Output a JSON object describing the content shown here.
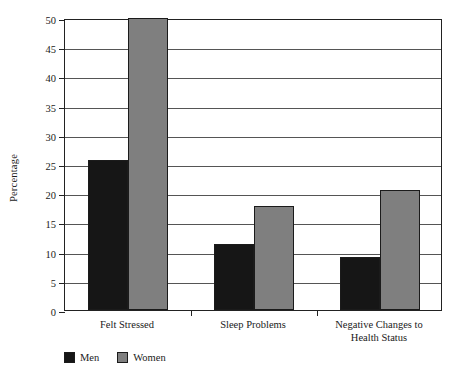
{
  "chart_data": {
    "type": "bar",
    "title": "",
    "xlabel": "",
    "ylabel": "Percentage",
    "ylim": [
      0,
      50
    ],
    "ytick_step": 5,
    "yticks": [
      0,
      5,
      10,
      15,
      20,
      25,
      30,
      35,
      40,
      45,
      50
    ],
    "ytick_labels": [
      "0",
      "5",
      "10",
      "15",
      "20",
      "25",
      "30",
      "35",
      "40",
      "45",
      "50"
    ],
    "grid": true,
    "grid_axis": "y",
    "legend_position": "below-bottom-left",
    "categories": [
      "Felt Stressed",
      "Sleep Problems",
      "Negative Changes to\nHealth Status"
    ],
    "series": [
      {
        "name": "Men",
        "color": "#161616",
        "values": [
          25.7,
          11.3,
          9.1
        ]
      },
      {
        "name": "Women",
        "color": "#7f7f7f",
        "values": [
          50.0,
          17.8,
          20.6
        ]
      }
    ]
  },
  "legend": {
    "items": [
      {
        "label": "Men",
        "color": "#161616"
      },
      {
        "label": "Women",
        "color": "#7f7f7f"
      }
    ]
  },
  "axis": {
    "y_title": "Percentage"
  }
}
